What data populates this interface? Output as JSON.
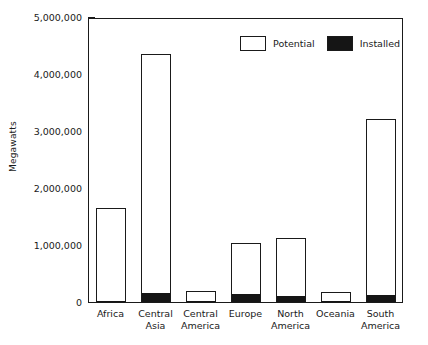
{
  "chart_data": {
    "type": "bar",
    "title": "",
    "xlabel": "",
    "ylabel": "Megawatts",
    "ylim": [
      0,
      5000000
    ],
    "yticks": [
      0,
      1000000,
      2000000,
      3000000,
      4000000,
      5000000
    ],
    "ytick_labels": [
      "0",
      "1,000,000",
      "2,000,000",
      "3,000,000",
      "4,000,000",
      "5,000,000"
    ],
    "grid": false,
    "legend_position": "top-right-inside",
    "categories": [
      "Africa",
      "Central Asia",
      "Central America",
      "Europe",
      "North America",
      "Oceania",
      "South America"
    ],
    "category_lines": [
      [
        "Africa"
      ],
      [
        "Central",
        "Asia"
      ],
      [
        "Central",
        "America"
      ],
      [
        "Europe"
      ],
      [
        "North",
        "America"
      ],
      [
        "Oceania"
      ],
      [
        "South",
        "America"
      ]
    ],
    "series": [
      {
        "name": "Potential",
        "color": "#ffffff",
        "edge_color": "#1a1a1a",
        "values": [
          1660000,
          4360000,
          210000,
          1050000,
          1140000,
          190000,
          3220000
        ]
      },
      {
        "name": "Installed",
        "color": "#151515",
        "edge_color": "#1a1a1a",
        "values": [
          25000,
          180000,
          15000,
          160000,
          120000,
          5000,
          135000
        ]
      }
    ]
  },
  "legend": {
    "entries": [
      {
        "label": "Potential",
        "swatch": "hollow"
      },
      {
        "label": "Installed",
        "swatch": "filled"
      }
    ]
  }
}
